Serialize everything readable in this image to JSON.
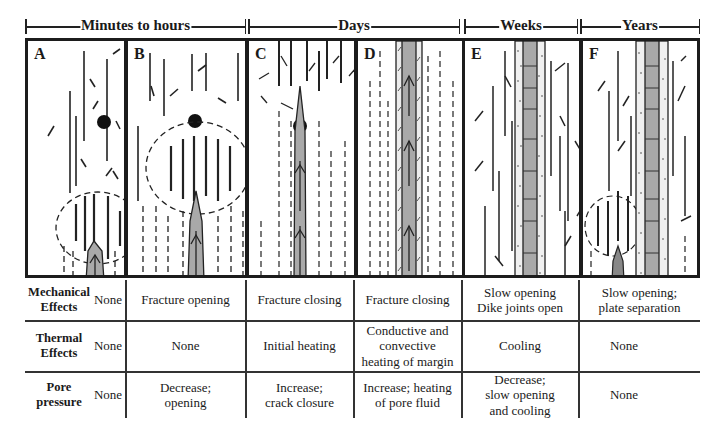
{
  "timescale": [
    {
      "label": "Minutes to hours",
      "x": 25,
      "w": 221
    },
    {
      "label": "Days",
      "x": 248,
      "w": 212
    },
    {
      "label": "Weeks",
      "x": 464,
      "w": 114
    },
    {
      "label": "Years",
      "x": 580,
      "w": 120
    }
  ],
  "panels": [
    {
      "letter": "A",
      "stage": "Minutes to hours",
      "description": "Dike tip propagating upward; fracture process zone ahead of tip"
    },
    {
      "letter": "B",
      "stage": "Minutes to hours",
      "description": "Fracture opening; dilated zone around tip reaches marker"
    },
    {
      "letter": "C",
      "stage": "Days",
      "description": "Dike tip passes marker; fractures closing"
    },
    {
      "letter": "D",
      "stage": "Days",
      "description": "Dike with heated margins; fracture closing"
    },
    {
      "letter": "E",
      "stage": "Weeks",
      "description": "Cooling dike with joints; chilled margins"
    },
    {
      "letter": "F",
      "stage": "Years",
      "description": "Plate separation; new dike intrudes alongside"
    }
  ],
  "table": {
    "rows": [
      {
        "label": "Mechanical Effects",
        "label_lines": [
          "Mechanical",
          "Effects"
        ],
        "cells": [
          "None",
          "Fracture opening",
          "Fracture closing",
          "Fracture closing",
          "Slow opening\nDike joints open",
          "Slow opening;\nplate separation"
        ]
      },
      {
        "label": "Thermal Effects",
        "label_lines": [
          "Thermal",
          "Effects"
        ],
        "cells": [
          "None",
          "None",
          "Initial heating",
          "Conductive and\nconvective\nheating of margin",
          "Cooling",
          "None"
        ]
      },
      {
        "label": "Pore pressure",
        "label_lines": [
          "Pore",
          "pressure"
        ],
        "cells": [
          "None",
          "Decrease;\nopening",
          "Increase;\ncrack closure",
          "Increase; heating\nof pore fluid",
          "Decrease;\nslow opening\nand cooling",
          "None"
        ]
      }
    ]
  },
  "colors": {
    "ink": "#1c1c1c",
    "dike_fill": "#a9a9a9",
    "margin_fill": "#e6e6e6",
    "background": "#ffffff"
  }
}
